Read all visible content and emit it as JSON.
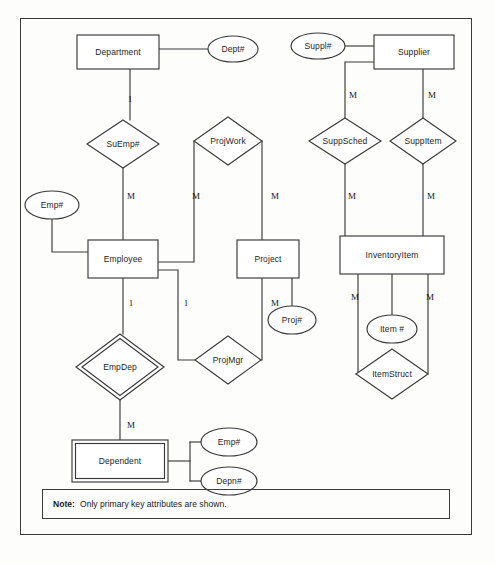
{
  "diagram": {
    "note": {
      "label": "Note:",
      "text": "Only primary key attributes are shown."
    },
    "entities": [
      {
        "id": "department",
        "label": "Department",
        "weak": false,
        "x": 118,
        "y": 52,
        "w": 82,
        "h": 34
      },
      {
        "id": "supplier",
        "label": "Supplier",
        "weak": false,
        "x": 414,
        "y": 52,
        "w": 80,
        "h": 34
      },
      {
        "id": "employee",
        "label": "Employee",
        "weak": false,
        "x": 123,
        "y": 259,
        "w": 70,
        "h": 38
      },
      {
        "id": "project",
        "label": "Project",
        "weak": false,
        "x": 268,
        "y": 259,
        "w": 62,
        "h": 38
      },
      {
        "id": "inventoryitem",
        "label": "InventoryItem",
        "weak": false,
        "x": 392,
        "y": 255,
        "w": 104,
        "h": 38
      },
      {
        "id": "dependent",
        "label": "Dependent",
        "weak": true,
        "x": 120,
        "y": 461,
        "w": 96,
        "h": 42
      }
    ],
    "relationships": [
      {
        "id": "suemp",
        "label": "SuEmp#",
        "weak": false,
        "x": 123,
        "y": 144,
        "rx": 36,
        "ry": 24
      },
      {
        "id": "projwork",
        "label": "ProjWork",
        "weak": false,
        "x": 228,
        "y": 141,
        "rx": 34,
        "ry": 24
      },
      {
        "id": "suppsched",
        "label": "SuppSched",
        "weak": false,
        "x": 345,
        "y": 141,
        "rx": 36,
        "ry": 23
      },
      {
        "id": "suppitem",
        "label": "SuppItem",
        "weak": false,
        "x": 423,
        "y": 141,
        "rx": 33,
        "ry": 23
      },
      {
        "id": "projmgr",
        "label": "ProjMgr",
        "weak": false,
        "x": 228,
        "y": 360,
        "rx": 33,
        "ry": 24
      },
      {
        "id": "empdep",
        "label": "EmpDep",
        "weak": true,
        "x": 120,
        "y": 367,
        "rx": 44,
        "ry": 33
      },
      {
        "id": "itemstruct",
        "label": "ItemStruct",
        "weak": false,
        "x": 392,
        "y": 374,
        "rx": 36,
        "ry": 25
      }
    ],
    "attributes": [
      {
        "id": "dept-num",
        "label": "Dept#",
        "x": 233,
        "y": 49,
        "rx": 25,
        "ry": 13
      },
      {
        "id": "suppl-num",
        "label": "Suppl#",
        "x": 318,
        "y": 46,
        "rx": 27,
        "ry": 13
      },
      {
        "id": "emp-num",
        "label": "Emp#",
        "x": 52,
        "y": 205,
        "rx": 27,
        "ry": 14
      },
      {
        "id": "proj-num",
        "label": "Proj#",
        "x": 292,
        "y": 320,
        "rx": 24,
        "ry": 14
      },
      {
        "id": "item-num",
        "label": "Item #",
        "x": 392,
        "y": 329,
        "rx": 25,
        "ry": 14
      },
      {
        "id": "dep-emp",
        "label": "Emp#",
        "x": 229,
        "y": 442,
        "rx": 28,
        "ry": 14
      },
      {
        "id": "dep-num",
        "label": "Depn#",
        "x": 229,
        "y": 481,
        "rx": 28,
        "ry": 14
      }
    ],
    "cardinalities": [
      {
        "id": "dept-suemp",
        "value": "1",
        "x": 130,
        "y": 99
      },
      {
        "id": "suemp-employee",
        "value": "M",
        "x": 131,
        "y": 196
      },
      {
        "id": "projwork-employee",
        "value": "M",
        "x": 196,
        "y": 196
      },
      {
        "id": "projwork-project",
        "value": "M",
        "x": 275,
        "y": 196
      },
      {
        "id": "supplier-suppsched",
        "value": "M",
        "x": 353,
        "y": 95
      },
      {
        "id": "supplier-suppitem",
        "value": "M",
        "x": 432,
        "y": 95
      },
      {
        "id": "suppsched-inv",
        "value": "M",
        "x": 352,
        "y": 196
      },
      {
        "id": "suppitem-inv",
        "value": "M",
        "x": 431,
        "y": 196
      },
      {
        "id": "employee-empdep",
        "value": "1",
        "x": 131,
        "y": 303
      },
      {
        "id": "employee-projmgr",
        "value": "1",
        "x": 186,
        "y": 303
      },
      {
        "id": "project-projmgr",
        "value": "M",
        "x": 275,
        "y": 303
      },
      {
        "id": "inv-left",
        "value": "M",
        "x": 355,
        "y": 297
      },
      {
        "id": "inv-right",
        "value": "M",
        "x": 430,
        "y": 297
      },
      {
        "id": "empdep-dependent",
        "value": "M",
        "x": 131,
        "y": 425
      }
    ],
    "colors": {
      "line": "#3a3a3a",
      "text": "#1d1d1d",
      "background": "#fdfdfc"
    }
  }
}
